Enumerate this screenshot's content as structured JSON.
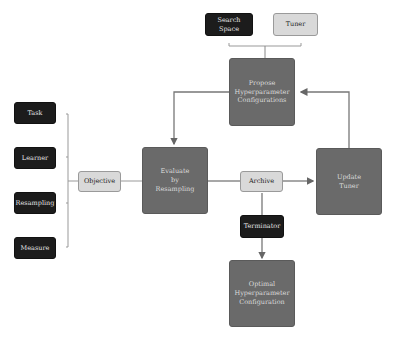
{
  "inputs": {
    "search_space": "Search Space",
    "tuner": "Tuner"
  },
  "objective_components": [
    "Task",
    "Learner",
    "Resampling",
    "Measure"
  ],
  "nodes": {
    "objective": "Objective",
    "propose": "Propose\nHyperparameter\nConfigurations",
    "evaluate": "Evaluate\nby\nResampling",
    "archive": "Archive",
    "update": "Update\nTuner",
    "terminator": "Terminator",
    "optimal": "Optimal\nHyperparameter\nConfiguration"
  },
  "colors": {
    "dark": "#1c1c1c",
    "light": "#d9d9d9",
    "mid": "#6a6a6a",
    "line": "#777777"
  }
}
